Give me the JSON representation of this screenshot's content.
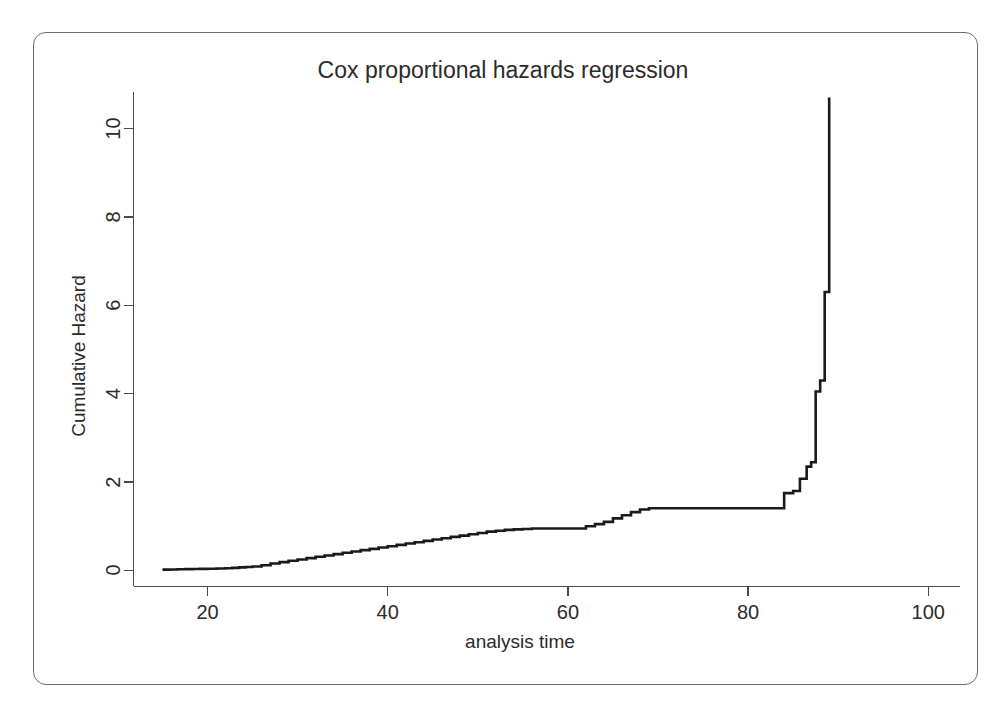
{
  "figure": {
    "border_color": "#6d6d6d",
    "background": "#ffffff"
  },
  "chart_data": {
    "type": "line",
    "subtype": "step",
    "title": "Cox proportional hazards regression",
    "xlabel": "analysis time",
    "ylabel": "Cumulative Hazard",
    "xlim": [
      14,
      102
    ],
    "ylim": [
      -0.35,
      11.2
    ],
    "grid": false,
    "legend": null,
    "line_color": "#1a1a1a",
    "axis_color": "#4a4a4a",
    "xticks": [
      20,
      40,
      60,
      80,
      100
    ],
    "xtick_labels": [
      "20",
      "40",
      "60",
      "80",
      "100"
    ],
    "yticks": [
      0,
      2,
      4,
      6,
      8,
      10
    ],
    "ytick_labels": [
      "0",
      "2",
      "4",
      "6",
      "8",
      "10"
    ],
    "series": [
      {
        "name": "Cumulative Hazard",
        "x": [
          15.0,
          17.5,
          20.0,
          22.0,
          23.5,
          25.0,
          26.0,
          27.0,
          28.0,
          29.0,
          30.0,
          31.0,
          32.0,
          33.0,
          34.0,
          35.0,
          36.0,
          37.0,
          38.0,
          39.0,
          40.0,
          41.0,
          42.0,
          43.0,
          44.0,
          45.0,
          46.0,
          47.0,
          48.0,
          49.0,
          50.0,
          51.0,
          52.0,
          53.0,
          54.0,
          55.0,
          56.0,
          61.0,
          62.0,
          63.0,
          64.0,
          65.0,
          66.0,
          67.0,
          68.0,
          69.0,
          83.0,
          84.0,
          85.0,
          86.5,
          87.0,
          87.5,
          88.0,
          88.5,
          89.0
        ],
        "y": [
          0.02,
          0.03,
          0.04,
          0.05,
          0.07,
          0.09,
          0.12,
          0.16,
          0.19,
          0.22,
          0.25,
          0.28,
          0.31,
          0.34,
          0.37,
          0.4,
          0.43,
          0.46,
          0.49,
          0.52,
          0.55,
          0.58,
          0.61,
          0.64,
          0.67,
          0.7,
          0.73,
          0.76,
          0.79,
          0.82,
          0.85,
          0.88,
          0.9,
          0.92,
          0.93,
          0.94,
          0.95,
          0.95,
          1.0,
          1.05,
          1.1,
          1.18,
          1.25,
          1.32,
          1.38,
          1.41,
          1.41,
          1.75,
          1.8,
          2.35,
          2.45,
          4.05,
          4.3,
          6.3,
          10.7
        ],
        "notes": "Right-continuous step function; plateaus at ~0.95 (t 56-61) and ~1.41 (t 69-83); sharp rise after t=83 reaching 10.70 at t=89"
      }
    ],
    "annotations": []
  }
}
